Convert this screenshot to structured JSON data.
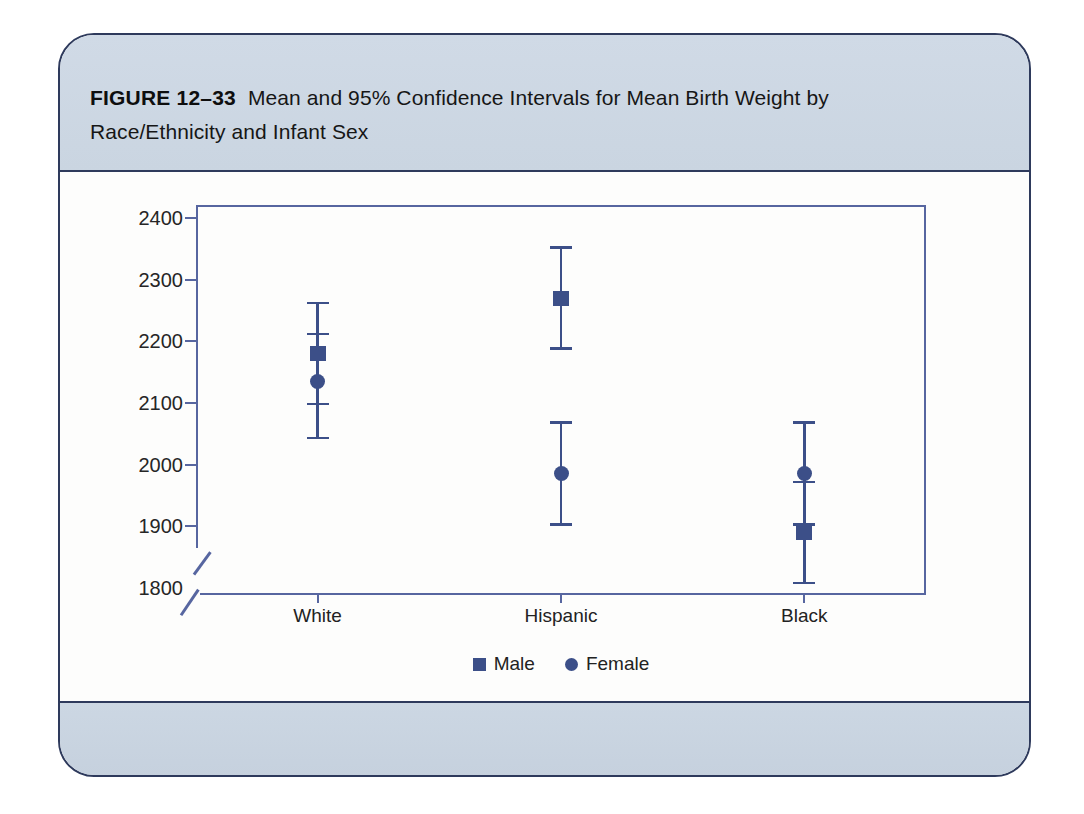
{
  "figure": {
    "label": "FIGURE 12–33",
    "title": "Mean and 95% Confidence Intervals for Mean Birth Weight by Race/Ethnicity and Infant Sex"
  },
  "chart_data": {
    "type": "scatter",
    "subtype": "means-with-95pct-ci-errorbars",
    "title": "Mean and 95% Confidence Intervals for Mean Birth Weight by Race/Ethnicity and Infant Sex",
    "categories": [
      "White",
      "Hispanic",
      "Black"
    ],
    "series": [
      {
        "name": "Male",
        "marker": "square",
        "means": [
          2180,
          2270,
          1890
        ],
        "ci_low": [
          2098,
          2188,
          1808
        ],
        "ci_high": [
          2262,
          2352,
          1972
        ]
      },
      {
        "name": "Female",
        "marker": "circle",
        "means": [
          2135,
          1985,
          1985
        ],
        "ci_low": [
          2043,
          1903,
          1903
        ],
        "ci_high": [
          2212,
          2068,
          2068
        ]
      }
    ],
    "xlabel": "",
    "ylabel": "",
    "y_ticks": [
      2400,
      2300,
      2200,
      2100,
      2000,
      1900,
      1800
    ],
    "ylim": [
      1800,
      2400
    ],
    "y_axis_break_below": 1900,
    "grid": false,
    "legend_position": "bottom"
  },
  "colors": {
    "marker": "#3c4f88",
    "axis_line": "#5766a0",
    "card_border": "#2e3a5c",
    "band_background": "#ccd7e3",
    "tick_text": "#262626"
  }
}
